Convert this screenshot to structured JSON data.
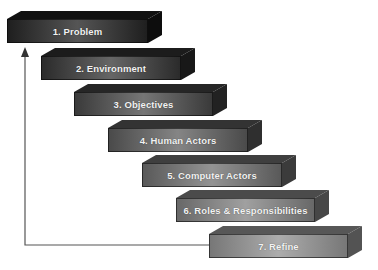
{
  "diagram": {
    "type": "staircase-process",
    "steps": [
      {
        "label": "1. Problem",
        "x": 7,
        "y": 11,
        "w": 141,
        "front": "#1f1f1f",
        "mid": "#555555",
        "top": "#111111",
        "side": "#0d0d0d"
      },
      {
        "label": "2. Environment",
        "x": 41,
        "y": 48,
        "w": 140,
        "front": "#2b2b2b",
        "mid": "#666666",
        "top": "#1c1c1c",
        "side": "#181818"
      },
      {
        "label": "3. Objectives",
        "x": 74,
        "y": 84,
        "w": 139,
        "front": "#3a3a3a",
        "mid": "#767676",
        "top": "#262626",
        "side": "#222222"
      },
      {
        "label": "4. Human Actors",
        "x": 108,
        "y": 120,
        "w": 140,
        "front": "#4a4a4a",
        "mid": "#858585",
        "top": "#333333",
        "side": "#2f2f2f"
      },
      {
        "label": "5. Computer Actors",
        "x": 142,
        "y": 155,
        "w": 140,
        "front": "#595959",
        "mid": "#939393",
        "top": "#3f3f3f",
        "side": "#3b3b3b"
      },
      {
        "label": "6. Roles & Responsibilities",
        "x": 176,
        "y": 190,
        "w": 139,
        "front": "#686868",
        "mid": "#a0a0a0",
        "top": "#4b4b4b",
        "side": "#474747"
      },
      {
        "label": "7. Refine",
        "x": 209,
        "y": 226,
        "w": 139,
        "front": "#777777",
        "mid": "#acacac",
        "top": "#575757",
        "side": "#535353"
      }
    ],
    "feedback_arrow": {
      "color": "#555555",
      "points": [
        [
          210,
          245
        ],
        [
          25,
          245
        ],
        [
          25,
          50
        ]
      ]
    }
  }
}
